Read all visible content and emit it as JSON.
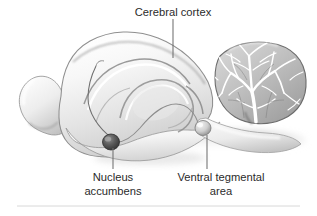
{
  "figure": {
    "background_color": "#ffffff",
    "text_color": "#2b2b2b",
    "leader_color": "#6f6f6f",
    "rule_color": "#d8d8d8",
    "width": 317,
    "height": 216
  },
  "labels": {
    "cerebral_cortex": {
      "line1": "Cerebral cortex",
      "line2": ""
    },
    "nucleus_accumbens": {
      "line1": "Nucleus",
      "line2": "accumbens"
    },
    "ventral_tegmental_area": {
      "line1": "Ventral tegmental",
      "line2": "area"
    }
  },
  "structures": {
    "cerebral_cortex": "cerebral-cortex",
    "cerebellum": "cerebellum",
    "olfactory_bulb": "olfactory-bulb",
    "brainstem": "brainstem",
    "corpus_callosum": "corpus-callosum",
    "nucleus_accumbens": "nucleus-accumbens-nucleus",
    "ventral_tegmental_area": "ventral-tegmental-area-nucleus",
    "mesolimbic_pathway": "mesolimbic-dopamine-pathway",
    "mesocortical_pathway": "mesocortical-pathway"
  }
}
